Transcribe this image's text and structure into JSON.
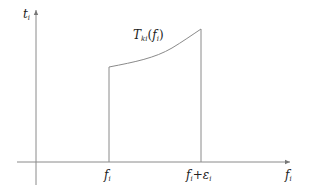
{
  "diagram": {
    "y_axis": {
      "label_main": "t",
      "label_sub": "i"
    },
    "x_axis": {
      "label_main": "f",
      "label_sub": "i"
    },
    "curve_label": {
      "main": "T",
      "sub": "ki",
      "arg_open": "(",
      "arg_main": "f",
      "arg_sub": "i",
      "arg_close": ")"
    },
    "ticks": [
      {
        "main": "f",
        "sub": "i"
      },
      {
        "main": "f",
        "sub": "i",
        "plus": "+",
        "eps": "ε",
        "eps_sub": "i"
      }
    ],
    "colors": {
      "line": "#8a8a8a",
      "text": "#222222"
    }
  }
}
